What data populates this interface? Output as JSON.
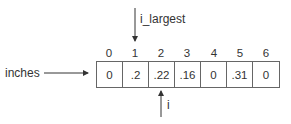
{
  "array": {
    "name": "inches",
    "indices": [
      "0",
      "1",
      "2",
      "3",
      "4",
      "5",
      "6"
    ],
    "values": [
      "0",
      ".2",
      ".22",
      ".16",
      "0",
      ".31",
      "0"
    ]
  },
  "pointers": {
    "top": {
      "label": "i_largest",
      "index": 1
    },
    "bottom": {
      "label": "i",
      "index": 2
    }
  }
}
